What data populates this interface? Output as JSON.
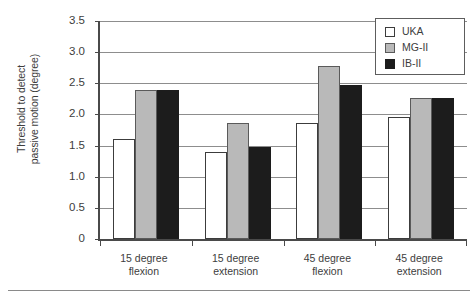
{
  "chart_data": {
    "type": "bar",
    "title": "",
    "xlabel": "",
    "ylabel": "Threshold to detect\npassive motion (degree)",
    "ylim": [
      0,
      3.5
    ],
    "ytick_labels": [
      "3.5",
      "3.0",
      "2.5",
      "2.0",
      "1.5",
      "1.0",
      "0.5",
      "0"
    ],
    "ytick_values": [
      3.5,
      3.0,
      2.5,
      2.0,
      1.5,
      1.0,
      0.5,
      0
    ],
    "grid": "horizontal",
    "legend_position": "top-right",
    "categories": [
      "15 degree\nflexion",
      "15 degree\nextension",
      "45 degree\nflexion",
      "45 degree\nextension"
    ],
    "series": [
      {
        "name": "UKA",
        "color": "#ffffff",
        "values": [
          1.6,
          1.39,
          1.86,
          1.96
        ]
      },
      {
        "name": "MG-II",
        "color": "#b9b9b9",
        "values": [
          2.39,
          1.86,
          2.77,
          2.26
        ]
      },
      {
        "name": "IB-II",
        "color": "#1c1c1c",
        "values": [
          2.39,
          1.48,
          2.47,
          2.26
        ]
      }
    ]
  }
}
